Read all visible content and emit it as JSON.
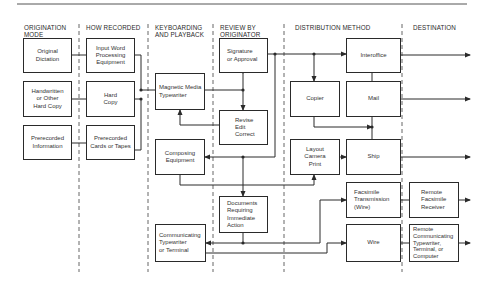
{
  "columns": [
    {
      "id": "origination",
      "label": "ORIGINATION\nMODE"
    },
    {
      "id": "how_recorded",
      "label": "HOW RECORDED"
    },
    {
      "id": "keyboarding",
      "label": "KEYBOARDING\nAND PLAYBACK"
    },
    {
      "id": "review",
      "label": "REVIEW BY\nORIGINATOR"
    },
    {
      "id": "distribution",
      "label": "DISTRIBUTION METHOD"
    },
    {
      "id": "destination",
      "label": "DESTINATION"
    }
  ],
  "nodes": {
    "original_dictation": "Original\nDictation",
    "handwritten": "Handwritten\nor Other\nHard Copy",
    "prerecorded_information": "Prerecorded\nInformation",
    "input_word_processing": "Input Word\nProcessing\nEquipment",
    "hard_copy": "Hard\nCopy",
    "prerecorded_cards": "Prerecorded\nCards or Tapes",
    "magnetic_media": "Magnetic Media\nTypewriter",
    "composing_equipment": "Composing\nEquipment",
    "communicating_typewriter": "Communicating\nTypewriter\nor Terminal",
    "signature_approval": "Signature\nor Approval",
    "revise_edit": "Revise\nEdit\nCorrect",
    "documents_requiring": "Documents\nRequiring\nImmediate\nAction",
    "interoffice": "Interoffice",
    "copier": "Copier",
    "mail": "Mail",
    "layout_camera": "Layout\nCamera\nPrint",
    "ship": "Ship",
    "facsimile_transmission": "Facsimile\nTransmission\n(Wire)",
    "wire": "Wire",
    "remote_facsimile": "Remote\nFacsimile\nReceiver",
    "remote_communicating": "Remote\nCommunicating\nTypewriter,\nTerminal, or\nComputer"
  },
  "colors": {
    "line": "#2a2a2a",
    "text": "#333333",
    "background": "#ffffff"
  }
}
